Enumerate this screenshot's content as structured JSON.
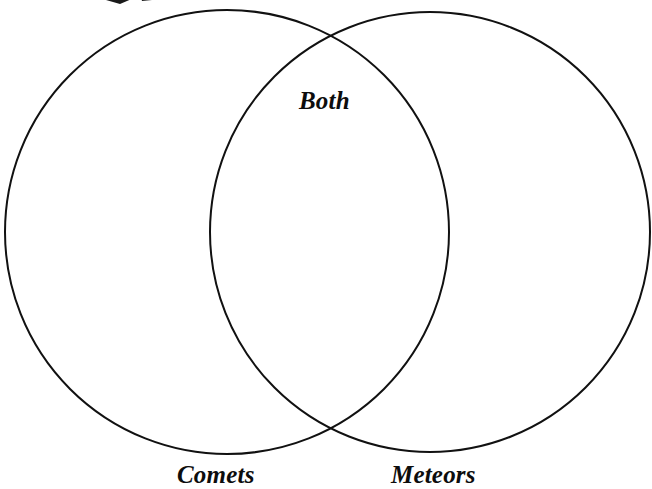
{
  "page": {
    "background_color": "#ffffff",
    "width": 652,
    "height": 489
  },
  "diagram": {
    "type": "venn-2-set",
    "stroke_color": "#111111",
    "stroke_width": 2,
    "fill": "none",
    "left_circle": {
      "cx": 227,
      "cy": 232,
      "r": 222,
      "label": "Comets"
    },
    "right_circle": {
      "cx": 430,
      "cy": 232,
      "r": 220,
      "label": "Meteors"
    },
    "overlap_label": "Both",
    "intersection_points": [
      {
        "x": 330,
        "y": 41
      },
      {
        "x": 330,
        "y": 425
      }
    ]
  },
  "labels": {
    "both": "Both",
    "left_set": "Comets",
    "right_set": "Meteors"
  },
  "artifacts": {
    "top_mark": "cropped-ink-mark"
  }
}
